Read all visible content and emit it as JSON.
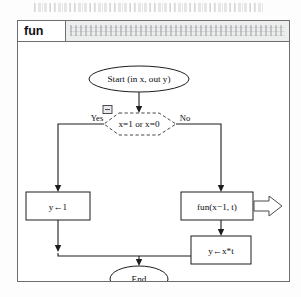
{
  "window": {
    "tab_label": "fun",
    "title_bar_placeholder": ""
  },
  "diagram": {
    "type": "flowchart",
    "nodes": [
      {
        "id": "start",
        "shape": "ellipse",
        "label": "Start (in x, out y)"
      },
      {
        "id": "decision",
        "shape": "hexagon",
        "label": "x=1 or x=0",
        "style": "dashed"
      },
      {
        "id": "assign1",
        "shape": "rectangle",
        "label": "y←1"
      },
      {
        "id": "call",
        "shape": "rectangle",
        "label": "fun(x−1, t)"
      },
      {
        "id": "assign2",
        "shape": "rectangle",
        "label": "y←x*t"
      },
      {
        "id": "end",
        "shape": "ellipse",
        "label": "End"
      }
    ],
    "edge_labels": {
      "yes": "Yes",
      "no": "No"
    },
    "annotations": {
      "collapse_toggle": "collapse-toggle-icon",
      "recursion_arrow": "recursion-block-arrow"
    }
  }
}
